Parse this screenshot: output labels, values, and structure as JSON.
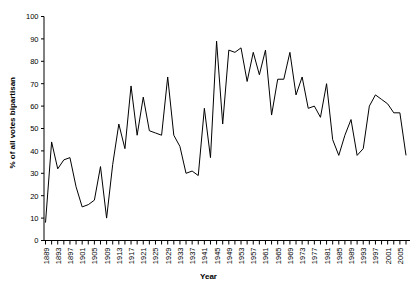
{
  "chart_data": {
    "type": "line",
    "title": "",
    "xlabel": "Year",
    "ylabel": "% of all votes bipartisan",
    "xlim": [
      1889,
      2007
    ],
    "ylim": [
      0,
      100
    ],
    "ytick_step": 10,
    "yticks": [
      0,
      10,
      20,
      30,
      40,
      50,
      60,
      70,
      80,
      90,
      100
    ],
    "xtick_labels": [
      "1889",
      "1893",
      "1897",
      "1901",
      "1905",
      "1909",
      "1913",
      "1917",
      "1921",
      "1925",
      "1929",
      "1933",
      "1937",
      "1941",
      "1945",
      "1949",
      "1953",
      "1957",
      "1961",
      "1965",
      "1969",
      "1973",
      "1977",
      "1981",
      "1985",
      "1989",
      "1993",
      "1997",
      "2001",
      "2005"
    ],
    "xtick_label_step_years": 4,
    "minor_tick_step_years": 2,
    "grid": false,
    "legend": null,
    "line_color": "#000000",
    "line_width": 1,
    "marker": "none",
    "x": [
      1889,
      1891,
      1893,
      1895,
      1897,
      1899,
      1901,
      1903,
      1905,
      1907,
      1909,
      1911,
      1913,
      1915,
      1917,
      1919,
      1921,
      1923,
      1925,
      1927,
      1929,
      1931,
      1933,
      1935,
      1937,
      1939,
      1941,
      1943,
      1945,
      1947,
      1949,
      1951,
      1953,
      1955,
      1957,
      1959,
      1961,
      1963,
      1965,
      1967,
      1969,
      1971,
      1973,
      1975,
      1977,
      1979,
      1981,
      1983,
      1985,
      1987,
      1989,
      1991,
      1993,
      1995,
      1997,
      1999,
      2001,
      2003,
      2005,
      2007
    ],
    "values": [
      8,
      44,
      32,
      36,
      37,
      24,
      15,
      16,
      18,
      33,
      10,
      34,
      52,
      41,
      69,
      47,
      64,
      49,
      48,
      47,
      73,
      47,
      42,
      30,
      31,
      29,
      59,
      37,
      89,
      52,
      85,
      84,
      86,
      71,
      84,
      74,
      85,
      56,
      72,
      72,
      84,
      65,
      73,
      59,
      60,
      55,
      70,
      45,
      38,
      47,
      54,
      38,
      41,
      60,
      65,
      63,
      61,
      57,
      57,
      38
    ],
    "series_name": "% of all votes bipartisan"
  },
  "axes": {
    "y_axis_name": "percent-axis",
    "x_axis_name": "year-axis"
  }
}
